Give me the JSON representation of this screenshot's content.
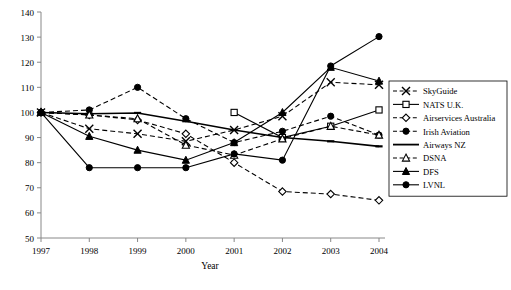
{
  "chart_data": {
    "type": "line",
    "title": "",
    "xlabel": "Year",
    "ylabel": "",
    "categories": [
      1997,
      1998,
      1999,
      2000,
      2001,
      2002,
      2003,
      2004
    ],
    "xtick_labels": [
      "1997",
      "1998",
      "1999",
      "2000",
      "2001",
      "2002",
      "2003",
      "2004"
    ],
    "ytick_labels": [
      "50",
      "60",
      "70",
      "80",
      "90",
      "100",
      "110",
      "120",
      "130",
      "140"
    ],
    "yticks": [
      50,
      60,
      70,
      80,
      90,
      100,
      110,
      120,
      130,
      140
    ],
    "ylim": [
      50,
      140
    ],
    "grid": false,
    "legend_position": "right",
    "series": [
      {
        "name": "SkyGuide",
        "marker": "x",
        "line": "dashed",
        "color": "#000000",
        "x": [
          1997,
          1998,
          1999,
          2000,
          2001,
          2002,
          2003,
          2004
        ],
        "values": [
          100,
          93.5,
          91.5,
          88.5,
          93,
          98.5,
          112,
          111
        ]
      },
      {
        "name": "NATS U.K.",
        "marker": "square-open",
        "line": "solid",
        "color": "#000000",
        "x": [
          2001,
          2002,
          2003,
          2004
        ],
        "values": [
          100,
          90,
          94.5,
          101
        ]
      },
      {
        "name": "Airservices Australia",
        "marker": "diamond-open",
        "line": "dashed",
        "color": "#000000",
        "x": [
          1997,
          1998,
          1999,
          2000,
          2001,
          2002,
          2003,
          2004
        ],
        "values": [
          100,
          99,
          97,
          91.5,
          80,
          68.5,
          67.5,
          65
        ]
      },
      {
        "name": "Irish Aviation",
        "marker": "circle-filled",
        "line": "dashed",
        "color": "#000000",
        "x": [
          1997,
          1998,
          1999,
          2000,
          2001,
          2002,
          2003,
          2004
        ],
        "values": [
          100,
          101,
          110,
          97.5,
          88,
          92.5,
          98.5,
          91
        ]
      },
      {
        "name": "Airways NZ",
        "marker": "none",
        "line": "solid",
        "color": "#000000",
        "x": [
          1997,
          1998,
          1999,
          2000,
          2001,
          2002,
          2003,
          2004
        ],
        "values": [
          100,
          99.5,
          99.8,
          96.5,
          93,
          90,
          88.5,
          86.5
        ]
      },
      {
        "name": "DSNA",
        "marker": "triangle-open",
        "line": "dashed",
        "color": "#000000",
        "x": [
          1997,
          1998,
          1999,
          2000,
          2001,
          2002,
          2003,
          2004
        ],
        "values": [
          100,
          99,
          97.5,
          87,
          83,
          89.5,
          94.5,
          91
        ]
      },
      {
        "name": "DFS",
        "marker": "triangle-filled",
        "line": "solid",
        "color": "#000000",
        "x": [
          1997,
          1998,
          1999,
          2000,
          2001,
          2002,
          2003,
          2004
        ],
        "values": [
          100,
          90.5,
          85,
          81,
          88,
          100,
          118,
          112.5
        ]
      },
      {
        "name": "LVNL",
        "marker": "circle-filled",
        "line": "solid",
        "color": "#000000",
        "x": [
          1997,
          1998,
          1999,
          2000,
          2001,
          2002,
          2003,
          2004
        ],
        "values": [
          100,
          78,
          78,
          78,
          83.5,
          81,
          118.5,
          130.2
        ]
      }
    ]
  },
  "legend": {
    "entries": [
      {
        "label": "SkyGuide"
      },
      {
        "label": "NATS U.K."
      },
      {
        "label": "Airservices Australia"
      },
      {
        "label": "Irish Aviation"
      },
      {
        "label": "Airways NZ"
      },
      {
        "label": "DSNA"
      },
      {
        "label": "DFS"
      },
      {
        "label": "LVNL"
      }
    ]
  }
}
